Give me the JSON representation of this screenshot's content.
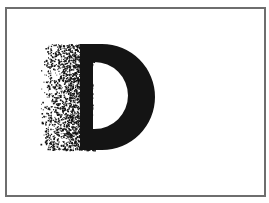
{
  "figure": {
    "letter": "D",
    "effect": "dissolve-left",
    "colors": {
      "ink": "#141414",
      "frame": "#6e6e6e",
      "background": "#ffffff"
    },
    "letter_box": {
      "x": 80,
      "y": 44,
      "right": 155,
      "bottom": 150
    },
    "counter_box": {
      "x": 93,
      "y": 62,
      "right": 128,
      "bottom": 129
    },
    "dither": {
      "x_start": 40,
      "x_end": 95,
      "y_start": 44,
      "y_end": 150,
      "dot_count": 2600,
      "seed": 7
    }
  }
}
